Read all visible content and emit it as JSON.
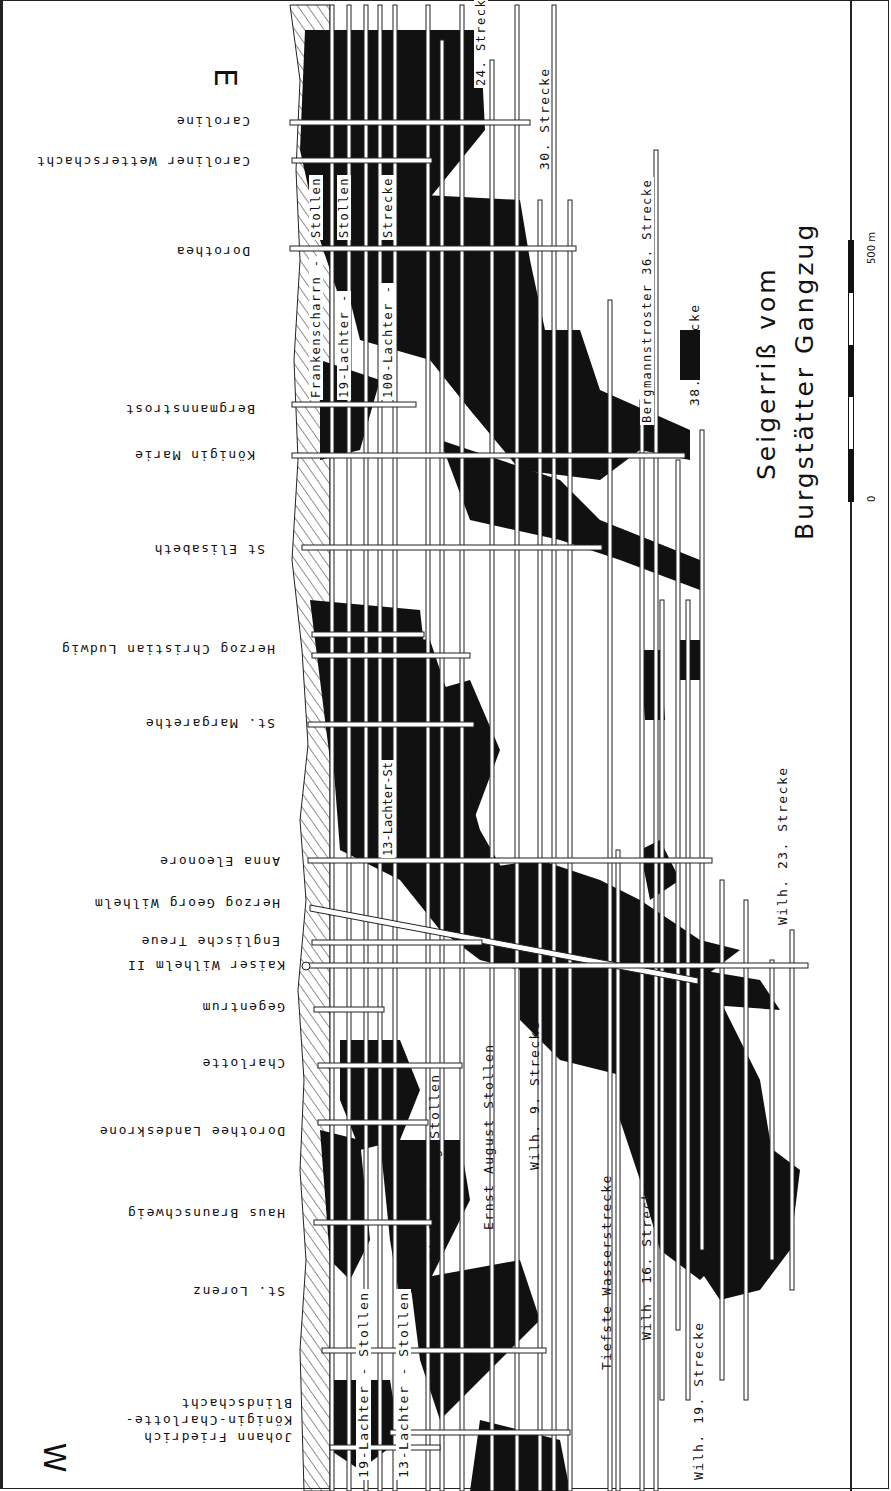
{
  "title": {
    "line1": "Seigerriß  vom",
    "line2": "Burgstätter  Gangzug"
  },
  "directions": {
    "west": "W",
    "east": "E"
  },
  "scale_bar": {
    "start": "0",
    "end": "500 m"
  },
  "shafts": [
    {
      "id": "johann-friedrich",
      "label": "Johann  Friedrich"
    },
    {
      "id": "koenigin-charlotte-blindschacht",
      "label": "Königin-Charlotte-",
      "label2": "Blindschacht"
    },
    {
      "id": "st-lorenz",
      "label": "St. Lorenz"
    },
    {
      "id": "haus-braunschweig",
      "label": "Haus Braunschweig"
    },
    {
      "id": "dorothee-landeskrone",
      "label": "Dorothee Landeskrone"
    },
    {
      "id": "charlotte",
      "label": "Charlotte"
    },
    {
      "id": "gegentrum",
      "label": "Gegentrum"
    },
    {
      "id": "kaiser-wilhelm-ii",
      "label": "Kaiser Wilhelm II"
    },
    {
      "id": "englische-treue",
      "label": "Englische  Treue"
    },
    {
      "id": "herzog-georg-wilhelm",
      "label": "Herzog  Georg  Wilhelm"
    },
    {
      "id": "anna-eleonore",
      "label": "Anna  Eleonore"
    },
    {
      "id": "st-margarethe",
      "label": "St. Margarethe"
    },
    {
      "id": "herzog-christian-ludwig",
      "label": "Herzog Christian Ludwig"
    },
    {
      "id": "st-elisabeth",
      "label": "St Elisabeth"
    },
    {
      "id": "koenigin-marie",
      "label": "Königin  Marie"
    },
    {
      "id": "bergmannstrost",
      "label": "Bergmannstrost"
    },
    {
      "id": "dorothea",
      "label": "Dorothea"
    },
    {
      "id": "caroliner-wetterschacht",
      "label": "Caroliner  Wetterschacht"
    },
    {
      "id": "caroline",
      "label": "Caroline"
    }
  ],
  "levels": {
    "west": [
      {
        "id": "19-lachter-stollen-w",
        "label": "19-Lachter -     Stollen"
      },
      {
        "id": "13-lachter-stollen-w",
        "label": "13-Lachter -     Stollen"
      },
      {
        "id": "tiefer-georg-stollen",
        "label": "Tiefer Georg Stollen"
      },
      {
        "id": "ernst-august-stollen",
        "label": "Ernst  August  Stollen"
      },
      {
        "id": "wilh-9-strecke",
        "label": "Wilh. 9. Strecke"
      },
      {
        "id": "tiefste-wasserstrecke",
        "label": "Tiefste  Wasserstrecke"
      },
      {
        "id": "wilh-16-strecke",
        "label": "Wilh.  16.  Strecke"
      },
      {
        "id": "wilh-19-strecke",
        "label": "Wilh.  19.  Strecke"
      },
      {
        "id": "wilh-23-strecke",
        "label": "Wilh.  23.  Strecke"
      }
    ],
    "center": [
      {
        "id": "13-lachter-st",
        "label": "13-Lachter-St"
      }
    ],
    "east": [
      {
        "id": "frankenscharrn-stollen",
        "label": "Frankenscharrn -",
        "label2": "Stollen"
      },
      {
        "id": "19-lachter-stollen-e",
        "label": "19-Lachter -",
        "label2": "Stollen"
      },
      {
        "id": "100-lachter-strecke",
        "label": "100-Lachter -",
        "label2": "Strecke"
      },
      {
        "id": "24-strecke",
        "label": "24. Strecke"
      },
      {
        "id": "30-strecke",
        "label": "30.  Strecke"
      },
      {
        "id": "bergmannstroster-36-strecke",
        "label": "Bergmannstroster  36. Strecke"
      },
      {
        "id": "38-strecke",
        "label": "38. Strecke"
      }
    ]
  }
}
